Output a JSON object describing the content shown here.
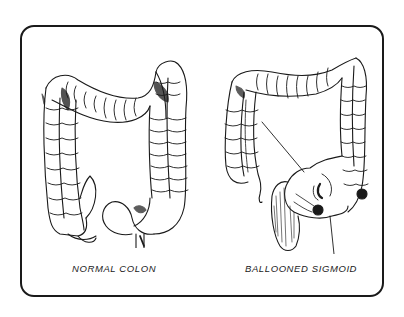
{
  "diagram": {
    "figures": [
      {
        "id": "normal",
        "caption": "NORMAL COLON"
      },
      {
        "id": "ballooned",
        "caption": "BALLOONED SIGMOID"
      }
    ],
    "colors": {
      "ink": "#1a1a1a",
      "background": "#ffffff"
    },
    "annotations": {
      "ballooned_pointer_lines": 2
    }
  }
}
